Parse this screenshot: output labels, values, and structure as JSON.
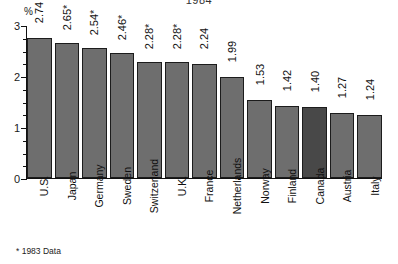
{
  "chart_data": {
    "type": "bar",
    "title": "1984",
    "xlabel": "",
    "ylabel": "%",
    "ylim": [
      0,
      3
    ],
    "yticks": [
      0,
      1,
      2,
      3
    ],
    "ytick_labels": [
      "0",
      "1",
      "2",
      "3"
    ],
    "minor_tick_interval": 0.25,
    "grid": false,
    "legend": null,
    "categories": [
      "U.S.",
      "Japan",
      "Germany",
      "Sweden",
      "Switzerland",
      "U.K.",
      "France",
      "Netherlands",
      "Norway",
      "Finland",
      "Canada",
      "Austria",
      "Italy"
    ],
    "values": [
      2.74,
      2.65,
      2.54,
      2.46,
      2.28,
      2.28,
      2.24,
      1.99,
      1.53,
      1.42,
      1.4,
      1.27,
      1.24
    ],
    "value_labels": [
      "2.74",
      "2.65*",
      "2.54*",
      "2.46*",
      "2.28*",
      "2.28*",
      "2.24",
      "1.99",
      "1.53",
      "1.42",
      "1.40",
      "1.27",
      "1.24"
    ],
    "footnote_marked": [
      "Japan",
      "Germany",
      "Sweden",
      "Switzerland",
      "U.K."
    ],
    "highlighted_category": "Canada",
    "annotations": [
      "* 1983 Data"
    ],
    "colors": {
      "bar": "#6e6e6e",
      "bar_highlight": "#484848",
      "bar_outline": "#1c1c1c",
      "axis": "#111111",
      "text": "#111111",
      "background": "#ffffff"
    }
  },
  "axis": {
    "y_unit_label": "%",
    "ticks": [
      {
        "label": "3",
        "value": 3
      },
      {
        "label": "2",
        "value": 2
      },
      {
        "label": "1",
        "value": 1
      },
      {
        "label": "0",
        "value": 0
      }
    ]
  },
  "footnote": {
    "text": "* 1983 Data"
  }
}
